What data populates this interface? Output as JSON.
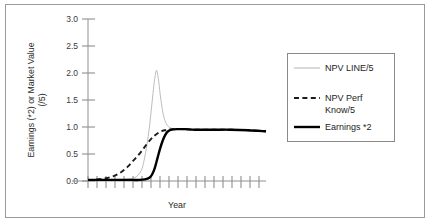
{
  "chart_data": {
    "type": "line",
    "title": "",
    "xlabel": "Year",
    "ylabel_line1": "Earnings (*2) or Market Value",
    "ylabel_line2": "(/5)",
    "ylim": [
      0.0,
      3.0
    ],
    "ytick_labels": [
      "0.0",
      "0.5",
      "1.0",
      "1.5",
      "2.0",
      "2.5",
      "3.0"
    ],
    "ytick_values": [
      0.0,
      0.5,
      1.0,
      1.5,
      2.0,
      2.5,
      3.0
    ],
    "xlim": [
      0,
      20
    ],
    "xtick_labels": [
      "",
      "",
      "",
      "",
      "",
      "",
      "",
      "",
      "",
      "",
      "",
      "",
      "",
      "",
      "",
      "",
      "",
      "",
      "",
      "",
      ""
    ],
    "xtick_values": [
      0,
      1,
      2,
      3,
      4,
      5,
      6,
      7,
      8,
      9,
      10,
      11,
      12,
      13,
      14,
      15,
      16,
      17,
      18,
      19,
      20
    ],
    "grid": false,
    "legend_position": "right-outside",
    "series": [
      {
        "name": "NPV LINE/5",
        "style": "solid-thin",
        "color": "#b4b4b4",
        "x": [
          0,
          1,
          2,
          3,
          4,
          5,
          5.5,
          6,
          6.3,
          6.6,
          6.9,
          7.1,
          7.3,
          7.5,
          7.7,
          7.9,
          8.1,
          8.3,
          8.5,
          8.8,
          9.1,
          9.5,
          10,
          11,
          12,
          14,
          16,
          18,
          20
        ],
        "y": [
          0.02,
          0.02,
          0.02,
          0.02,
          0.03,
          0.05,
          0.09,
          0.2,
          0.38,
          0.65,
          1.0,
          1.3,
          1.62,
          1.9,
          2.05,
          1.9,
          1.62,
          1.38,
          1.2,
          1.06,
          1.0,
          0.97,
          0.96,
          0.95,
          0.95,
          0.95,
          0.95,
          0.94,
          0.92
        ]
      },
      {
        "name": "NPV Perf Know/5",
        "style": "dashed",
        "color": "#1c1c1c",
        "x": [
          0,
          0.5,
          1,
          1.5,
          2,
          2.5,
          3,
          3.5,
          4,
          4.5,
          5,
          5.5,
          6,
          6.5,
          7,
          7.4,
          7.8,
          8.2,
          8.6,
          9,
          9.6,
          10.5,
          12,
          14,
          16,
          18,
          20
        ],
        "y": [
          0.02,
          0.02,
          0.03,
          0.04,
          0.05,
          0.07,
          0.1,
          0.14,
          0.2,
          0.27,
          0.36,
          0.45,
          0.55,
          0.66,
          0.76,
          0.83,
          0.88,
          0.92,
          0.94,
          0.95,
          0.96,
          0.96,
          0.95,
          0.95,
          0.95,
          0.94,
          0.92
        ]
      },
      {
        "name": "Earnings *2",
        "style": "solid-thick",
        "color": "#000000",
        "x": [
          0,
          1,
          2,
          3,
          4,
          5,
          5.8,
          6.4,
          6.9,
          7.2,
          7.5,
          7.8,
          8.1,
          8.4,
          8.7,
          9,
          9.4,
          10,
          11,
          12,
          14,
          16,
          18,
          20
        ],
        "y": [
          0.02,
          0.02,
          0.02,
          0.02,
          0.02,
          0.02,
          0.02,
          0.03,
          0.06,
          0.12,
          0.24,
          0.42,
          0.6,
          0.75,
          0.86,
          0.92,
          0.95,
          0.96,
          0.96,
          0.95,
          0.95,
          0.95,
          0.94,
          0.92
        ]
      }
    ]
  },
  "legend": {
    "items": [
      {
        "label": "NPV LINE/5",
        "swatch": "thin-gray-line"
      },
      {
        "label_line1": "NPV Perf",
        "label_line2": "Know/5",
        "swatch": "dashed-black-line"
      },
      {
        "label": "Earnings *2",
        "swatch": "thick-black-line"
      }
    ]
  }
}
